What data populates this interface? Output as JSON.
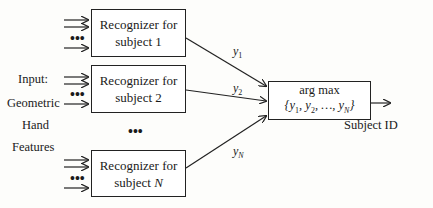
{
  "input_label": [
    "Input:",
    "Geometric",
    "Hand",
    "Features"
  ],
  "recognizers": [
    {
      "line1": "Recognizer for",
      "line2_prefix": "subject ",
      "line2_var": "1",
      "output": "y",
      "output_sub": "1"
    },
    {
      "line1": "Recognizer for",
      "line2_prefix": "subject ",
      "line2_var": "2",
      "output": "y",
      "output_sub": "2"
    },
    {
      "line1": "Recognizer for",
      "line2_prefix": "subject ",
      "line2_var": "N",
      "output": "y",
      "output_sub": "N"
    }
  ],
  "ellipsis": "•••",
  "argmax": {
    "title": "arg max",
    "expr": "{y₁, y₂, …, y_N}"
  },
  "output_label": "Subject ID"
}
